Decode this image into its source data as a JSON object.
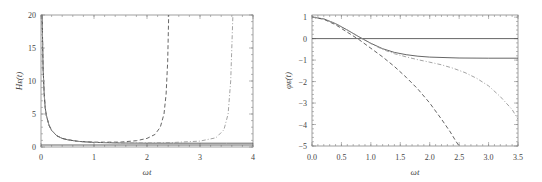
{
  "chart_data": [
    {
      "type": "line",
      "title": "",
      "xlabel": "ωt",
      "ylabel": "H_E(t)",
      "xlim": [
        0,
        4
      ],
      "ylim": [
        0,
        20
      ],
      "xticks": [
        0,
        1,
        2,
        3,
        4
      ],
      "xtick_labels": [
        "0",
        "1",
        "2",
        "3",
        "4"
      ],
      "yticks": [
        0,
        5,
        10,
        15,
        20
      ],
      "ytick_labels": [
        "0",
        "5",
        "10",
        "15",
        "20"
      ],
      "grid": false,
      "legend": "none",
      "series": [
        {
          "name": "solid",
          "style": "solid",
          "x": [
            0.02,
            0.04,
            0.06,
            0.08,
            0.1,
            0.15,
            0.2,
            0.3,
            0.4,
            0.5,
            0.7,
            1.0,
            1.5,
            2.0,
            2.5,
            3.0,
            3.5,
            4.0
          ],
          "y": [
            20,
            12,
            8,
            6,
            4.8,
            3.3,
            2.5,
            1.7,
            1.3,
            1.1,
            0.85,
            0.7,
            0.6,
            0.58,
            0.57,
            0.57,
            0.57,
            0.57
          ]
        },
        {
          "name": "dashed",
          "style": "dashed",
          "x": [
            0.02,
            0.04,
            0.06,
            0.08,
            0.1,
            0.15,
            0.2,
            0.3,
            0.4,
            0.5,
            0.7,
            1.0,
            1.5,
            1.8,
            2.0,
            2.15,
            2.25,
            2.32,
            2.36,
            2.39,
            2.41
          ],
          "y": [
            20,
            12,
            8,
            6,
            4.8,
            3.3,
            2.5,
            1.7,
            1.3,
            1.1,
            0.85,
            0.72,
            0.75,
            0.95,
            1.3,
            1.9,
            3.0,
            5.0,
            8.0,
            13,
            20
          ]
        },
        {
          "name": "dot-dashed",
          "style": "dashdot",
          "x": [
            0.02,
            0.04,
            0.06,
            0.08,
            0.1,
            0.15,
            0.2,
            0.3,
            0.4,
            0.5,
            0.7,
            1.0,
            1.5,
            2.0,
            2.5,
            3.0,
            3.3,
            3.45,
            3.53,
            3.58,
            3.62
          ],
          "y": [
            20,
            12,
            8,
            6,
            4.8,
            3.3,
            2.5,
            1.7,
            1.3,
            1.1,
            0.85,
            0.7,
            0.62,
            0.62,
            0.68,
            0.9,
            1.4,
            2.6,
            5.0,
            10,
            20
          ]
        },
        {
          "name": "baseline",
          "style": "solid",
          "x": [
            0,
            4
          ],
          "y": [
            0.3,
            0.3
          ]
        }
      ]
    },
    {
      "type": "line",
      "title": "",
      "xlabel": "ωt",
      "ylabel": "φ_E(t)",
      "xlim": [
        0,
        3.5
      ],
      "ylim": [
        -5,
        1.1
      ],
      "xticks": [
        0.0,
        0.5,
        1.0,
        1.5,
        2.0,
        2.5,
        3.0,
        3.5
      ],
      "xtick_labels": [
        "0.0",
        "0.5",
        "1.0",
        "1.5",
        "2.0",
        "2.5",
        "3.0",
        "3.5"
      ],
      "yticks": [
        -5,
        -4,
        -3,
        -2,
        -1,
        0,
        1
      ],
      "ytick_labels": [
        "−5",
        "−4",
        "−3",
        "−2",
        "−1",
        "0",
        "1"
      ],
      "grid": false,
      "legend": "none",
      "series": [
        {
          "name": "zero-line",
          "style": "solid",
          "x": [
            0,
            3.5
          ],
          "y": [
            0,
            0
          ]
        },
        {
          "name": "solid",
          "style": "solid",
          "x": [
            0,
            0.2,
            0.4,
            0.6,
            0.8,
            1.0,
            1.2,
            1.4,
            1.6,
            1.8,
            2.0,
            2.5,
            3.0,
            3.5
          ],
          "y": [
            1.0,
            0.92,
            0.7,
            0.4,
            0.08,
            -0.22,
            -0.47,
            -0.64,
            -0.75,
            -0.82,
            -0.86,
            -0.9,
            -0.91,
            -0.91
          ]
        },
        {
          "name": "dashed",
          "style": "dashed",
          "x": [
            0,
            0.2,
            0.4,
            0.6,
            0.8,
            1.0,
            1.2,
            1.4,
            1.6,
            1.8,
            2.0,
            2.2,
            2.35,
            2.45,
            2.5
          ],
          "y": [
            1.0,
            0.9,
            0.65,
            0.3,
            -0.05,
            -0.45,
            -0.85,
            -1.3,
            -1.8,
            -2.35,
            -3.0,
            -3.75,
            -4.35,
            -4.8,
            -5.0
          ]
        },
        {
          "name": "dot-dashed",
          "style": "dashdot",
          "x": [
            0,
            0.2,
            0.4,
            0.6,
            0.8,
            1.0,
            1.2,
            1.4,
            1.6,
            1.8,
            2.0,
            2.2,
            2.4,
            2.6,
            2.8,
            3.0,
            3.2,
            3.4,
            3.5
          ],
          "y": [
            1.0,
            0.92,
            0.7,
            0.4,
            0.08,
            -0.23,
            -0.5,
            -0.7,
            -0.85,
            -0.98,
            -1.1,
            -1.22,
            -1.38,
            -1.58,
            -1.85,
            -2.2,
            -2.7,
            -3.3,
            -3.75
          ]
        }
      ]
    }
  ]
}
